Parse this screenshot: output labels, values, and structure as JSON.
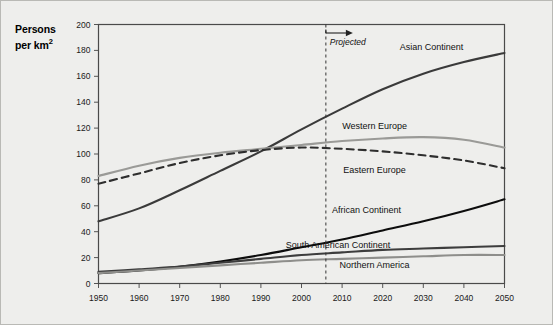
{
  "chart_data": {
    "type": "line",
    "title": "",
    "xlabel": "",
    "ylabel": "Persons per km2",
    "ylabel_line1": "Persons",
    "ylabel_line2": "per km",
    "ylabel_superscript": "2",
    "xlim": [
      1950,
      2050
    ],
    "ylim": [
      0,
      200
    ],
    "xticks": [
      1950,
      1960,
      1970,
      1980,
      1990,
      2000,
      2010,
      2020,
      2030,
      2040,
      2050
    ],
    "yticks": [
      0,
      20,
      40,
      60,
      80,
      100,
      120,
      140,
      160,
      180,
      200
    ],
    "grid": false,
    "legend_position": "inline-right-of-series",
    "annotations": [
      {
        "name": "projected-divider",
        "label": "Projected",
        "x": 2006,
        "style": "vertical-dashed-line-with-right-arrow"
      }
    ],
    "x": [
      1950,
      1960,
      1970,
      1980,
      1990,
      2000,
      2010,
      2020,
      2030,
      2040,
      2050
    ],
    "series": [
      {
        "name": "Asian Continent",
        "color": "#3a3a3a",
        "style": "solid",
        "width": 2.1,
        "label_x": 2032,
        "label_y": 183,
        "values": [
          48,
          58,
          72,
          87,
          102,
          119,
          135,
          150,
          162,
          171,
          178
        ]
      },
      {
        "name": "Western Europe",
        "color": "#9a9a97",
        "style": "solid",
        "width": 2.1,
        "label_x": 2018,
        "label_y": 122,
        "values": [
          83,
          91,
          97,
          101,
          104,
          107,
          110,
          112,
          113,
          111,
          105
        ]
      },
      {
        "name": "Eastern Europe",
        "color": "#2e2e2e",
        "style": "dashed",
        "width": 2.1,
        "label_x": 2018,
        "label_y": 88,
        "values": [
          77,
          85,
          93,
          99,
          103,
          105,
          104,
          102,
          99,
          95,
          89
        ]
      },
      {
        "name": "African Continent",
        "color": "#0d0d0d",
        "style": "solid",
        "width": 2.1,
        "label_x": 2016,
        "label_y": 57,
        "values": [
          8,
          10,
          13,
          17,
          22,
          28,
          34,
          41,
          48,
          56,
          65
        ]
      },
      {
        "name": "South American Continent",
        "color": "#3d3d3d",
        "style": "solid",
        "width": 2.1,
        "label_x": 2009,
        "label_y": 30,
        "values": [
          9,
          11,
          13,
          16,
          19,
          22,
          24,
          26,
          27,
          28,
          29
        ]
      },
      {
        "name": "Northern America",
        "color": "#8e8e8b",
        "style": "solid",
        "width": 2.1,
        "label_x": 2018,
        "label_y": 14,
        "values": [
          8,
          10,
          12,
          14,
          16,
          18,
          19,
          20,
          21,
          22,
          22
        ]
      }
    ]
  }
}
